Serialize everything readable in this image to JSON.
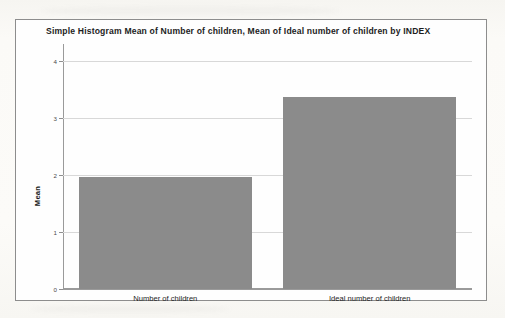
{
  "chart_data": {
    "type": "bar",
    "title": "Simple Histogram Mean of Number of children, Mean of Ideal number of children by INDEX",
    "xlabel": "",
    "ylabel": "Mean",
    "categories": [
      "Number of children",
      "Ideal number of children"
    ],
    "values": [
      1.96,
      3.37
    ],
    "ylim": [
      0,
      4.3
    ],
    "yticks": [
      0,
      1,
      2,
      3,
      4
    ],
    "ytick_labels": [
      "0",
      "1",
      "2",
      "3",
      "4"
    ],
    "grid": true,
    "legend": "none",
    "bar_color": "#8b8b8b",
    "axis_color": "#9a9a9a",
    "gridline_color": "#d8d8d8",
    "frame_color": "#8d8d8d",
    "background_color": "#fefefe"
  }
}
